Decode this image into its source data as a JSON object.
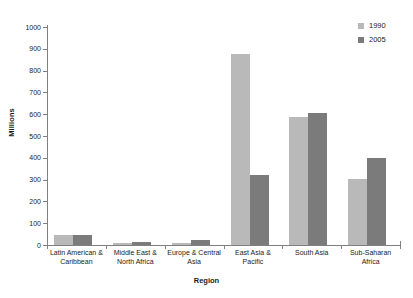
{
  "chart_data": {
    "type": "bar",
    "title": "",
    "xlabel": "Region",
    "ylabel": "Millions",
    "ylim": [
      0,
      1000
    ],
    "yticks": [
      0,
      100,
      200,
      300,
      400,
      500,
      600,
      700,
      800,
      900,
      1000
    ],
    "grid": false,
    "legend_position": "top-right",
    "categories": [
      "Latin American & Caribbean",
      "Middle East & North Africa",
      "Europe & Central Asia",
      "East Asia & Pacific",
      "South Asia",
      "Sub-Saharan Africa"
    ],
    "category_lines": [
      [
        "Latin American &",
        "Caribbean"
      ],
      [
        "Middle East &",
        "North Africa"
      ],
      [
        "Europe & Central",
        "Asia"
      ],
      [
        "East Asia &",
        "Pacific"
      ],
      [
        "South Asia",
        ""
      ],
      [
        "Sub-Saharan",
        "Africa"
      ]
    ],
    "series": [
      {
        "name": "1990",
        "color": "#b9b9b9",
        "values": [
          45,
          10,
          10,
          875,
          585,
          305
        ]
      },
      {
        "name": "2005",
        "color": "#7b7b7b",
        "values": [
          48,
          13,
          22,
          320,
          605,
          400
        ]
      }
    ]
  },
  "axis": {
    "y_title": "Millions",
    "x_title": "Region",
    "y_tick_labels": [
      "1000",
      "900",
      "800",
      "700",
      "600",
      "500",
      "400",
      "300",
      "200",
      "100",
      "0"
    ]
  },
  "legend": {
    "items": [
      {
        "label": "1990",
        "color": "#b9b9b9"
      },
      {
        "label": "2005",
        "color": "#7b7b7b"
      }
    ]
  },
  "colors": {
    "series_1990": "#b9b9b9",
    "series_2005": "#7b7b7b",
    "axis": "#808080",
    "text": "#1a1a1a",
    "background": "#ffffff"
  }
}
